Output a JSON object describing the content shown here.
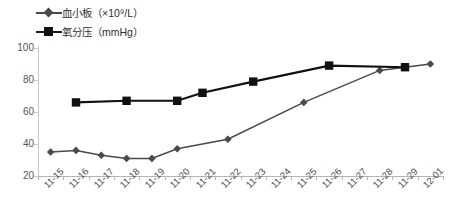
{
  "chart_data": {
    "type": "line",
    "title": "",
    "xlabel": "",
    "ylabel": "",
    "grid": false,
    "legend_position": "top-left",
    "ylim": [
      20,
      100
    ],
    "yticks": [
      20,
      40,
      60,
      80,
      100
    ],
    "categories": [
      "11-15",
      "11-16",
      "11-17",
      "11-18",
      "11-19",
      "11-20",
      "11-21",
      "11-22",
      "11-23",
      "11-24",
      "11-25",
      "11-26",
      "11-27",
      "11-28",
      "11-29",
      "12-01"
    ],
    "series": [
      {
        "name": "血小板（×10⁹/L）",
        "marker": "diamond",
        "color": "#4a4a4a",
        "values": [
          35,
          36,
          33,
          31,
          31,
          37,
          null,
          43,
          null,
          null,
          66,
          null,
          null,
          86,
          null,
          90
        ]
      },
      {
        "name": "氧分压（mmHg）",
        "marker": "square",
        "color": "#111111",
        "values": [
          null,
          66,
          null,
          67,
          null,
          67,
          72,
          null,
          79,
          null,
          null,
          89,
          null,
          null,
          88,
          null
        ]
      }
    ]
  },
  "legend": {
    "items": [
      {
        "label": "血小板（×10⁹/L）",
        "marker": "diamond"
      },
      {
        "label": "氧分压（mmHg）",
        "marker": "square"
      }
    ]
  },
  "axes": {
    "y_tick_labels": [
      "100",
      "80",
      "60",
      "40",
      "20"
    ],
    "x_tick_labels": [
      "11-15",
      "11-16",
      "11-17",
      "11-18",
      "11-19",
      "11-20",
      "11-21",
      "11-22",
      "11-23",
      "11-24",
      "11-25",
      "11-26",
      "11-27",
      "11-28",
      "11-29",
      "12-01"
    ]
  },
  "colors": {
    "series_platelet": "#4a4a4a",
    "series_oxygen": "#111111",
    "axis": "#c0c0c0",
    "background": "#ffffff"
  }
}
